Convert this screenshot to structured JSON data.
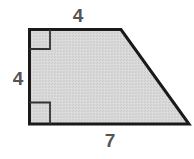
{
  "diagram": {
    "shape": "right trapezoid",
    "colors": {
      "fill": "#d6d6d6",
      "stroke": "#1a1a1a",
      "label": "#555555"
    },
    "labels": {
      "top": "4",
      "left": "4",
      "bottom": "7"
    },
    "right_angle_markers": [
      "top-left",
      "bottom-left"
    ]
  }
}
